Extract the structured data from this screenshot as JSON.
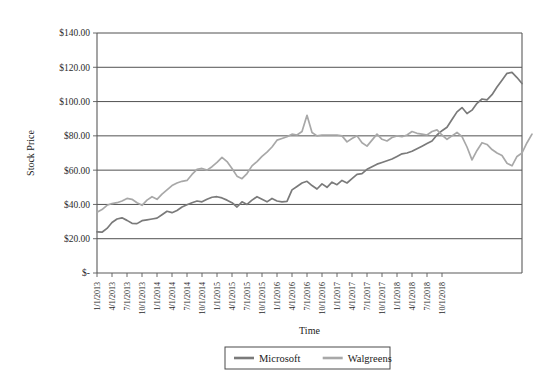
{
  "chart_data": {
    "type": "line",
    "title": "",
    "xlabel": "Time",
    "ylabel": "Stock Price",
    "grid": true,
    "legend_position": "bottom",
    "ylim": [
      0,
      140
    ],
    "yticks": [
      0,
      20,
      40,
      60,
      80,
      100,
      120,
      140
    ],
    "ytick_labels": [
      "$-",
      "$20.00",
      "$40.00",
      "$60.00",
      "$80.00",
      "$100.00",
      "$120.00",
      "$140.00"
    ],
    "xtick_labels": [
      "1/1/2013",
      "4/1/2013",
      "7/1/2013",
      "10/1/2013",
      "1/1/2014",
      "4/1/2014",
      "7/1/2014",
      "10/1/2014",
      "1/1/2015",
      "4/1/2015",
      "7/1/2015",
      "10/1/2015",
      "1/1/2016",
      "4/1/2016",
      "7/1/2016",
      "10/1/2016",
      "1/1/2017",
      "4/1/2017",
      "7/1/2017",
      "10/1/2017",
      "1/1/2018",
      "4/1/2018",
      "7/1/2018",
      "10/1/2018"
    ],
    "x_start": "1/1/2013",
    "x_end": "10/1/2018",
    "x_interval_months": 1,
    "series": [
      {
        "name": "Microsoft",
        "color": "#7a7a7a",
        "values": [
          24.0,
          23.8,
          26.0,
          29.5,
          31.5,
          32.2,
          30.7,
          29.0,
          28.8,
          30.5,
          31.0,
          31.5,
          32.0,
          34.0,
          36.0,
          35.2,
          36.5,
          38.5,
          39.8,
          41.0,
          42.0,
          41.5,
          43.0,
          44.2,
          44.5,
          43.8,
          42.5,
          41.0,
          38.5,
          41.5,
          40.0,
          42.5,
          44.5,
          43.0,
          41.5,
          43.5,
          42.0,
          41.5,
          41.8,
          48.5,
          50.5,
          52.5,
          53.5,
          51.0,
          49.0,
          52.0,
          50.0,
          53.0,
          51.5,
          54.0,
          52.5,
          55.0,
          57.5,
          58.0,
          60.5,
          62.0,
          63.5,
          64.5,
          65.5,
          66.5,
          68.0,
          69.5,
          70.0,
          71.0,
          72.5,
          74.0,
          75.5,
          77.0,
          80.5,
          83.0,
          85.0,
          89.5,
          94.0,
          96.5,
          93.0,
          95.0,
          99.0,
          101.5,
          101.0,
          104.0,
          108.5,
          112.5,
          116.5,
          117.0,
          114.0,
          110.5
        ]
      },
      {
        "name": "Walgreens",
        "color": "#a8a8a8",
        "values": [
          35.5,
          37.0,
          39.5,
          40.5,
          41.0,
          42.0,
          43.5,
          43.0,
          41.0,
          39.5,
          42.5,
          44.5,
          43.0,
          46.0,
          48.5,
          51.0,
          52.5,
          53.5,
          54.0,
          57.5,
          60.5,
          61.0,
          60.0,
          62.0,
          64.5,
          67.5,
          65.0,
          61.0,
          56.5,
          55.0,
          58.0,
          62.5,
          65.0,
          68.0,
          70.5,
          73.5,
          77.5,
          78.5,
          79.5,
          81.0,
          80.5,
          82.5,
          92.0,
          82.0,
          80.0,
          80.5,
          80.5,
          80.5,
          80.5,
          80.0,
          76.5,
          78.5,
          80.0,
          76.0,
          74.0,
          77.5,
          81.0,
          78.0,
          77.0,
          79.0,
          80.0,
          79.5,
          80.5,
          82.5,
          81.5,
          81.0,
          80.5,
          82.5,
          83.5,
          80.5,
          78.0,
          80.0,
          82.0,
          79.5,
          73.5,
          66.0,
          71.5,
          76.0,
          75.0,
          72.0,
          70.0,
          68.5,
          64.0,
          62.5,
          68.0,
          70.0,
          76.0,
          81.0
        ]
      }
    ]
  },
  "legend": {
    "items": [
      {
        "label": "Microsoft",
        "color": "#7a7a7a"
      },
      {
        "label": "Walgreens",
        "color": "#a8a8a8"
      }
    ]
  }
}
